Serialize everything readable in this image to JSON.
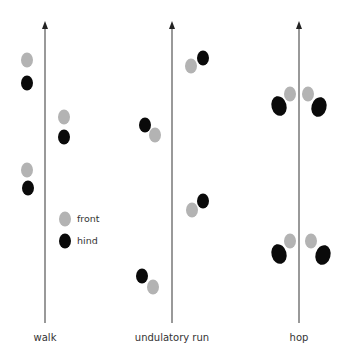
{
  "colors": {
    "front": "#b3b3b3",
    "hind": "#0a0a0a",
    "axis": "#555555"
  },
  "legend": {
    "items": [
      {
        "label": "front",
        "color": "#b3b3b3"
      },
      {
        "label": "hind",
        "color": "#0a0a0a"
      }
    ]
  },
  "panels": [
    {
      "label": "walk",
      "axis_x": 45,
      "footprints": [
        {
          "type": "front",
          "x": 27,
          "y": 60
        },
        {
          "type": "hind",
          "x": 27,
          "y": 83
        },
        {
          "type": "front",
          "x": 64,
          "y": 117
        },
        {
          "type": "hind",
          "x": 64,
          "y": 137
        },
        {
          "type": "front",
          "x": 27,
          "y": 170
        },
        {
          "type": "hind",
          "x": 28,
          "y": 188
        }
      ]
    },
    {
      "label": "undulatory run",
      "axis_x": 172,
      "footprints": [
        {
          "type": "hind",
          "x": 203,
          "y": 58
        },
        {
          "type": "front",
          "x": 191,
          "y": 66
        },
        {
          "type": "hind",
          "x": 145,
          "y": 125
        },
        {
          "type": "front",
          "x": 155,
          "y": 135
        },
        {
          "type": "hind",
          "x": 203,
          "y": 201
        },
        {
          "type": "front",
          "x": 192,
          "y": 210
        },
        {
          "type": "hind",
          "x": 142,
          "y": 276
        },
        {
          "type": "front",
          "x": 153,
          "y": 287
        }
      ]
    },
    {
      "label": "hop",
      "axis_x": 299,
      "footprints": [
        {
          "type": "front",
          "x": 290,
          "y": 94
        },
        {
          "type": "front",
          "x": 308,
          "y": 94
        },
        {
          "type": "hind",
          "x": 279,
          "y": 106
        },
        {
          "type": "hind",
          "x": 319,
          "y": 107
        },
        {
          "type": "front",
          "x": 290,
          "y": 241
        },
        {
          "type": "front",
          "x": 311,
          "y": 241
        },
        {
          "type": "hind",
          "x": 279,
          "y": 254
        },
        {
          "type": "hind",
          "x": 323,
          "y": 255
        }
      ]
    }
  ]
}
